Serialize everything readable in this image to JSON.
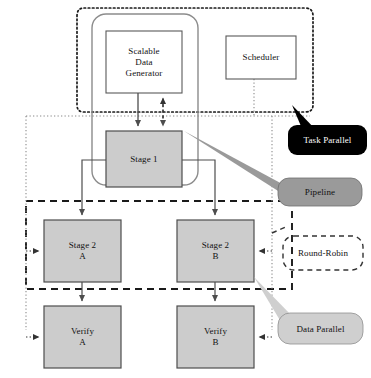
{
  "diagram": {
    "colors": {
      "process_fill": "#cccccc",
      "process_stroke": "#4d4d4d",
      "white_fill": "#ffffff",
      "white_stroke": "#595959",
      "pipeline_container_stroke": "#8c8c8c",
      "task_parallel_boundary": "#1a1a1a",
      "data_parallel_boundary": "#1a1a1a",
      "scheduler_bus": "#808080",
      "flow_arrow": "#4d4d4d",
      "callout_task_parallel_fill": "#000000",
      "callout_pipeline_fill": "#9a9a9a",
      "callout_data_parallel_fill": "#cfcfcf",
      "callout_round_robin_fill": "none",
      "callout_round_robin_stroke": "#333333"
    },
    "nodes": [
      {
        "id": "scalable-data-generator",
        "lines": [
          "Scalable",
          "Data",
          "Generator"
        ],
        "style": "white"
      },
      {
        "id": "scheduler",
        "lines": [
          "Scheduler"
        ],
        "style": "white"
      },
      {
        "id": "stage-1",
        "lines": [
          "Stage 1"
        ],
        "style": "process"
      },
      {
        "id": "stage-2-a",
        "lines": [
          "Stage 2",
          "A"
        ],
        "style": "process"
      },
      {
        "id": "stage-2-b",
        "lines": [
          "Stage 2",
          "B"
        ],
        "style": "process"
      },
      {
        "id": "verify-a",
        "lines": [
          "Verify",
          "A"
        ],
        "style": "process"
      },
      {
        "id": "verify-b",
        "lines": [
          "Verify",
          "B"
        ],
        "style": "process"
      }
    ],
    "callouts": [
      {
        "id": "task-parallel",
        "label": "Task Parallel",
        "style": "dark-bubble"
      },
      {
        "id": "pipeline",
        "label": "Pipeline",
        "style": "mid-bubble"
      },
      {
        "id": "round-robin",
        "label": "Round-Robin",
        "style": "dashed-outline"
      },
      {
        "id": "data-parallel",
        "label": "Data Parallel",
        "style": "light-bubble"
      }
    ],
    "regions": [
      {
        "id": "task-parallel-region",
        "boundary": "dotted-heavy"
      },
      {
        "id": "pipeline-region",
        "boundary": "rounded-solid"
      },
      {
        "id": "data-parallel-region",
        "boundary": "dashed-heavy"
      },
      {
        "id": "scheduler-bus-region",
        "boundary": "dotted-fine"
      }
    ]
  }
}
